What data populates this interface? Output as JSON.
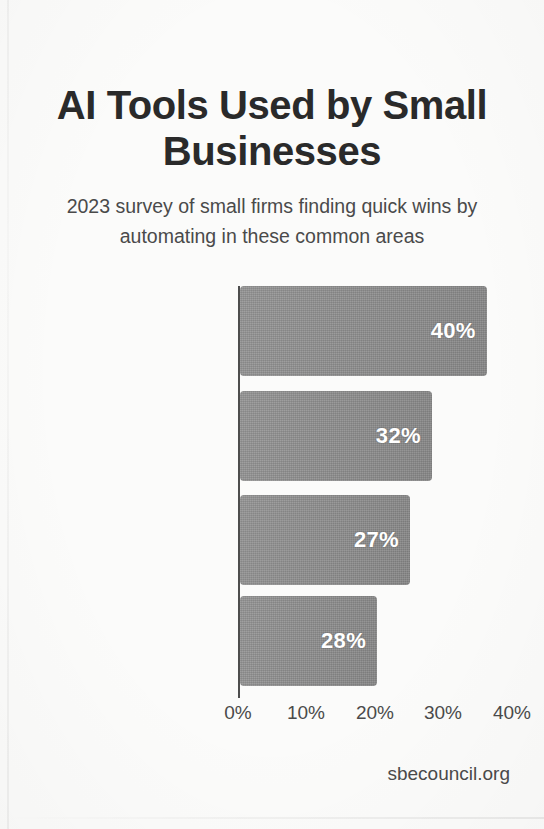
{
  "chart_data": {
    "type": "bar",
    "orientation": "horizontal",
    "title": "AI Tools Used by Small Businesses",
    "subtitle": "2023 survey of small firms finding quick wins by automating in these common areas",
    "categories": [
      "Financial Management",
      "Email Marketing Automation",
      "Customer Service Chatbots",
      "Inventory Management"
    ],
    "values": [
      40,
      32,
      27,
      28
    ],
    "value_labels": [
      "40%",
      "32%",
      "27%",
      "28%"
    ],
    "bar_drawn_percent": [
      36,
      28,
      24.8,
      20
    ],
    "xlabel": "",
    "ylabel": "",
    "xlim": [
      0,
      40
    ],
    "xticks": [
      0,
      10,
      20,
      30,
      40
    ],
    "xtick_labels": [
      "0%",
      "10%",
      "20%",
      "30%",
      "40%"
    ],
    "grid": false,
    "legend": false,
    "bar_color": "#8d8d8d",
    "value_label_color": "#ffffff",
    "axis_color": "#4d4d4d",
    "background_color": "#fbfbfa",
    "text_color": "#3a3a3a",
    "source": "sbecouncil.org"
  },
  "layout": {
    "axis_x_px": 238,
    "px_per_ten_percent": 68.5,
    "bar_rows_top_px": [
      0,
      105,
      209,
      310
    ],
    "xtick_x_px": [
      238,
      306,
      375,
      443,
      512
    ]
  }
}
